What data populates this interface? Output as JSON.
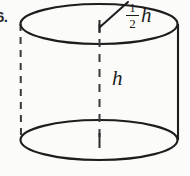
{
  "figure": {
    "name": "cylinder-diagram",
    "shape": "cylinder",
    "item_number": "6.",
    "background_color": "#fbfbfa",
    "stroke_color": "#1d1d1d",
    "labels": {
      "radius": {
        "numerator": "1",
        "denominator": "2",
        "variable": "h",
        "full_text": "1/2 h",
        "meaning": "radius"
      },
      "height": {
        "variable": "h",
        "full_text": "h",
        "meaning": "height"
      }
    },
    "geometry": {
      "top_ellipse": {
        "cx": 99,
        "cy": 24,
        "rx": 79,
        "ry": 20,
        "style": "solid"
      },
      "bottom_ellipse": {
        "cx": 99,
        "cy": 140,
        "rx": 79,
        "ry": 20,
        "style": "solid"
      },
      "left_wall": {
        "x": 20,
        "y1": 24,
        "y2": 140,
        "style": "dashed"
      },
      "right_wall": {
        "x": 178,
        "y1": 24,
        "y2": 140,
        "style": "solid"
      },
      "center_axis": {
        "x": 99,
        "y1": 24,
        "y2": 140,
        "style": "dashed"
      },
      "radius_leader": {
        "x1": 100,
        "y1": 26,
        "x2": 128,
        "y2": 3,
        "style": "solid"
      }
    }
  }
}
